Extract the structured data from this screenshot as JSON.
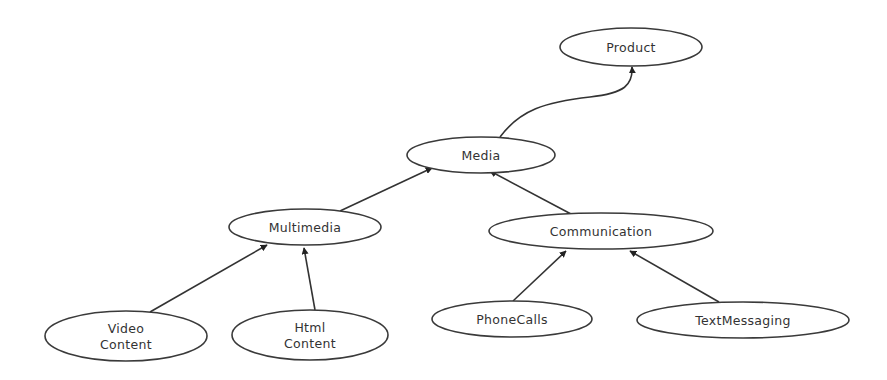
{
  "diagram": {
    "type": "hierarchy",
    "colors": {
      "stroke": "#3a3a3a",
      "text": "#333333",
      "background": "#ffffff"
    },
    "nodes": [
      {
        "id": "product",
        "label": [
          "Product"
        ],
        "cx": 631,
        "cy": 47,
        "rx": 71,
        "ry": 19
      },
      {
        "id": "media",
        "label": [
          "Media"
        ],
        "cx": 481,
        "cy": 155,
        "rx": 74,
        "ry": 18
      },
      {
        "id": "multimedia",
        "label": [
          "Multimedia"
        ],
        "cx": 305,
        "cy": 227,
        "rx": 76,
        "ry": 18
      },
      {
        "id": "communication",
        "label": [
          "Communication"
        ],
        "cx": 601,
        "cy": 231,
        "rx": 112,
        "ry": 18
      },
      {
        "id": "video-content",
        "label": [
          "Video",
          "Content"
        ],
        "cx": 126,
        "cy": 336,
        "rx": 81,
        "ry": 25
      },
      {
        "id": "html-content",
        "label": [
          "Html",
          "Content"
        ],
        "cx": 310,
        "cy": 335,
        "rx": 78,
        "ry": 25
      },
      {
        "id": "phonecalls",
        "label": [
          "PhoneCalls"
        ],
        "cx": 512,
        "cy": 319,
        "rx": 80,
        "ry": 18
      },
      {
        "id": "textmessaging",
        "label": [
          "TextMessaging"
        ],
        "cx": 743,
        "cy": 320,
        "rx": 106,
        "ry": 18
      }
    ],
    "edges": [
      {
        "from": "media",
        "to": "product",
        "path": "M 500 137 C 520 110, 545 102, 590 97 C 625 93, 633 85, 632 67"
      },
      {
        "from": "multimedia",
        "to": "media",
        "path": "M 340 211 L 432 168"
      },
      {
        "from": "communication",
        "to": "media",
        "path": "M 571 214 L 490 171"
      },
      {
        "from": "video-content",
        "to": "multimedia",
        "path": "M 150 312 L 267 245"
      },
      {
        "from": "html-content",
        "to": "multimedia",
        "path": "M 315 310 L 304 248"
      },
      {
        "from": "phonecalls",
        "to": "communication",
        "path": "M 513 301 L 566 251"
      },
      {
        "from": "textmessaging",
        "to": "communication",
        "path": "M 719 302 L 630 251"
      }
    ]
  }
}
